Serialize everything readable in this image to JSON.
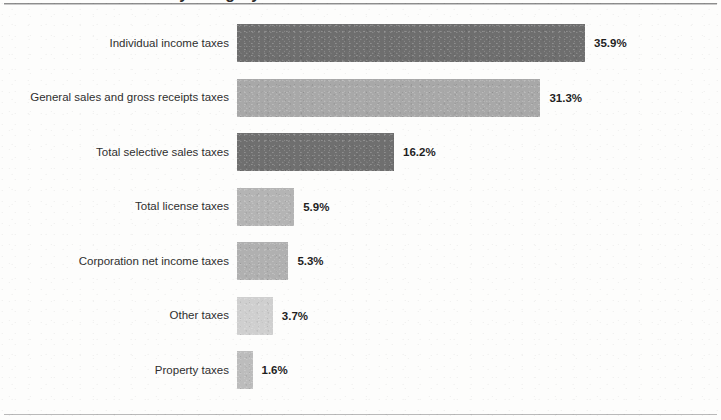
{
  "title": {
    "text": "State tax collections by category",
    "visible_fragment": "collections by category"
  },
  "chart_data": {
    "type": "bar",
    "orientation": "horizontal",
    "title": "State tax collections by category",
    "xlabel": "",
    "ylabel": "",
    "grid": false,
    "legend": null,
    "xlim": [
      0,
      35.9
    ],
    "value_suffix": "%",
    "categories": [
      "Individual income taxes",
      "General sales and gross receipts taxes",
      "Total selective sales taxes",
      "Total license taxes",
      "Corporation net income taxes",
      "Other taxes",
      "Property taxes"
    ],
    "values": [
      35.9,
      31.3,
      16.2,
      5.9,
      5.3,
      3.7,
      1.6
    ],
    "value_labels": [
      "35.9%",
      "31.3%",
      "16.2%",
      "5.9%",
      "5.3%",
      "3.7%",
      "1.6%"
    ],
    "bar_colors": [
      "#6e6e6e",
      "#a8a8a8",
      "#6f6f6f",
      "#b4b4b4",
      "#b0b0b0",
      "#cfcfcf",
      "#bcbcbc"
    ]
  },
  "colors": {
    "background": "#fdfdfc",
    "rule": "#8d8d8d",
    "label_text": "#2f2f2f",
    "value_text": "#1f1f1f"
  }
}
